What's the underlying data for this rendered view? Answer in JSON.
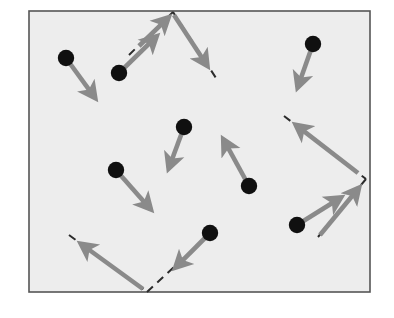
{
  "figure": {
    "type": "diagram",
    "canvas": {
      "width": 394,
      "height": 318,
      "background": "#ffffff"
    },
    "frame": {
      "name": "plot-frame",
      "x": 29,
      "y": 11,
      "width": 341,
      "height": 281,
      "fill": "#ededed",
      "stroke": "#555555",
      "stroke_width": 1.6
    },
    "colors": {
      "dot": "#101010",
      "arrow": "#8a8a8a",
      "dashed": "#2b2b2b",
      "frame_stroke": "#555555",
      "frame_fill": "#ededed",
      "page_background": "#ffffff"
    },
    "style": {
      "dot_radius": 8.2,
      "arrow_stroke_width": 4.6,
      "arrow_head_length": 17,
      "arrow_head_width": 15,
      "dash_pattern": "8,6",
      "dash_stroke_width": 2.0
    },
    "dots": [
      {
        "id": "dot-1",
        "label": "point-upper-left",
        "x": 66,
        "y": 58
      },
      {
        "id": "dot-2",
        "label": "point-upper-mid",
        "x": 119,
        "y": 73
      },
      {
        "id": "dot-3",
        "label": "point-center-upper",
        "x": 184,
        "y": 127
      },
      {
        "id": "dot-4",
        "label": "point-left-mid",
        "x": 116,
        "y": 170
      },
      {
        "id": "dot-5",
        "label": "point-center-right",
        "x": 249,
        "y": 186
      },
      {
        "id": "dot-6",
        "label": "point-upper-right",
        "x": 313,
        "y": 44
      },
      {
        "id": "dot-7",
        "label": "point-lower-right",
        "x": 297,
        "y": 225
      },
      {
        "id": "dot-8",
        "label": "point-lower-mid",
        "x": 210,
        "y": 233
      }
    ],
    "arrows": [
      {
        "id": "arrow-1",
        "label": "vector-from-upper-left",
        "from_dot": "dot-1",
        "x1": 66,
        "y1": 58,
        "x2": 98,
        "y2": 102
      },
      {
        "id": "arrow-2",
        "label": "vector-from-upper-mid",
        "from_dot": "dot-2",
        "x1": 119,
        "y1": 73,
        "x2": 160,
        "y2": 33
      },
      {
        "id": "arrow-3",
        "label": "vector-from-center-upper",
        "from_dot": "dot-3",
        "x1": 184,
        "y1": 127,
        "x2": 167,
        "y2": 173
      },
      {
        "id": "arrow-4",
        "label": "vector-from-left-mid",
        "from_dot": "dot-4",
        "x1": 116,
        "y1": 170,
        "x2": 154,
        "y2": 213
      },
      {
        "id": "arrow-5",
        "label": "vector-from-center-right",
        "from_dot": "dot-5",
        "x1": 249,
        "y1": 186,
        "x2": 221,
        "y2": 135
      },
      {
        "id": "arrow-6",
        "label": "vector-from-upper-right",
        "from_dot": "dot-6",
        "x1": 313,
        "y1": 44,
        "x2": 296,
        "y2": 92
      },
      {
        "id": "arrow-7",
        "label": "vector-from-lower-right",
        "from_dot": "dot-7",
        "x1": 297,
        "y1": 225,
        "x2": 345,
        "y2": 195
      },
      {
        "id": "arrow-8",
        "label": "vector-from-lower-mid",
        "from_dot": "dot-8",
        "x1": 210,
        "y1": 233,
        "x2": 172,
        "y2": 271
      }
    ],
    "dashed_lines": [
      {
        "id": "dash-top-left",
        "label": "separatrix-top-left-segment",
        "x1": 129,
        "y1": 55,
        "x2": 173,
        "y2": 12
      },
      {
        "id": "dash-top-right",
        "label": "separatrix-top-right-segment",
        "x1": 173,
        "y1": 12,
        "x2": 216,
        "y2": 78
      },
      {
        "id": "dash-right-upper",
        "label": "separatrix-right-upper-segment",
        "x1": 284,
        "y1": 116,
        "x2": 366,
        "y2": 179
      },
      {
        "id": "dash-right-lower",
        "label": "separatrix-right-lower-segment",
        "x1": 366,
        "y1": 179,
        "x2": 318,
        "y2": 237
      },
      {
        "id": "dash-bottom-left",
        "label": "separatrix-bottom-left-segment",
        "x1": 69,
        "y1": 235,
        "x2": 147,
        "y2": 292
      },
      {
        "id": "dash-bottom-right",
        "label": "separatrix-bottom-right-segment",
        "x1": 147,
        "y1": 292,
        "x2": 186,
        "y2": 256
      }
    ],
    "dashed_arrows": [
      {
        "id": "dash-arrow-1",
        "label": "vector-along-top-left-dashed",
        "x1": 139,
        "y1": 46,
        "x2": 172,
        "y2": 14
      },
      {
        "id": "dash-arrow-2",
        "label": "vector-along-top-right-dashed",
        "x1": 174,
        "y1": 15,
        "x2": 210,
        "y2": 70
      },
      {
        "id": "dash-arrow-3",
        "label": "vector-along-right-upper-dashed",
        "x1": 358,
        "y1": 173,
        "x2": 292,
        "y2": 122
      },
      {
        "id": "dash-arrow-4",
        "label": "vector-along-right-lower-dashed",
        "x1": 320,
        "y1": 235,
        "x2": 362,
        "y2": 184
      },
      {
        "id": "dash-arrow-5",
        "label": "vector-along-bottom-left-dashed",
        "x1": 143,
        "y1": 289,
        "x2": 77,
        "y2": 241
      }
    ],
    "vertices": [
      {
        "id": "vertex-top",
        "label": "separatrix-vertex-top",
        "x": 173,
        "y": 12
      },
      {
        "id": "vertex-right",
        "label": "separatrix-vertex-right",
        "x": 366,
        "y": 179
      },
      {
        "id": "vertex-bottom",
        "label": "separatrix-vertex-bottom",
        "x": 147,
        "y": 292
      }
    ]
  }
}
